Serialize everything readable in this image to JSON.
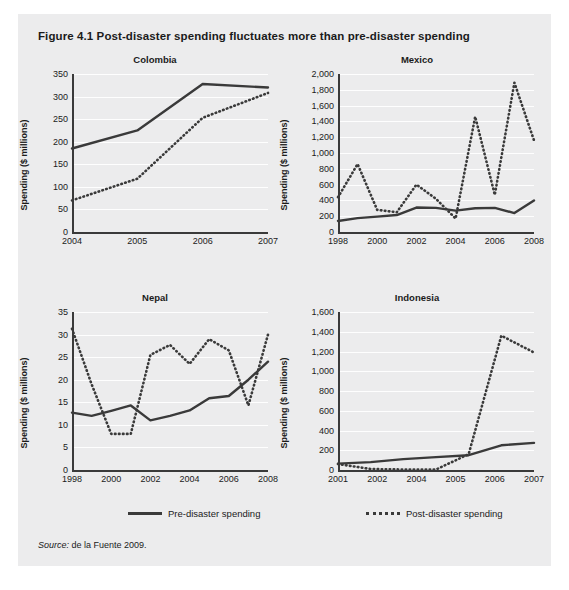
{
  "figure": {
    "number": "Figure 4.1",
    "title": "Figure 4.1  Post-disaster spending fluctuates more than pre-disaster spending",
    "source_label": "Source:",
    "source_text": "de la Fuente 2009."
  },
  "legend": {
    "pre_label": "Pre-disaster spending",
    "post_label": "Post-disaster spending",
    "series_colors": {
      "pre": "#3a3a3a",
      "post": "#3a3a3a"
    },
    "position": "bottom"
  },
  "chart_data": [
    {
      "type": "line",
      "title": "Colombia",
      "xlabel": "",
      "ylabel": "Spending ($ millions)",
      "x": [
        2004,
        2005,
        2006,
        2007
      ],
      "xticks": [
        "2004",
        "2005",
        "2006",
        "2007"
      ],
      "yticks": [
        "0",
        "50",
        "100",
        "150",
        "200",
        "250",
        "300",
        "350"
      ],
      "ylim": [
        0,
        350
      ],
      "grid": true,
      "series": [
        {
          "name": "Pre-disaster spending",
          "style": "solid",
          "values": [
            185,
            225,
            328,
            320
          ]
        },
        {
          "name": "Post-disaster spending",
          "style": "dotted",
          "values": [
            70,
            118,
            253,
            308
          ]
        }
      ]
    },
    {
      "type": "line",
      "title": "Mexico",
      "xlabel": "",
      "ylabel": "Spending ($ millions)",
      "x": [
        1998,
        1999,
        2000,
        2001,
        2002,
        2003,
        2004,
        2005,
        2006,
        2007,
        2008
      ],
      "xticks": [
        "1998",
        "2000",
        "2002",
        "2004",
        "2006",
        "2008"
      ],
      "yticks": [
        "0",
        "200",
        "400",
        "600",
        "800",
        "1,000",
        "1,200",
        "1,400",
        "1,600",
        "1,800",
        "2,000"
      ],
      "ylim": [
        0,
        2000
      ],
      "grid": true,
      "series": [
        {
          "name": "Pre-disaster spending",
          "style": "solid",
          "values": [
            140,
            175,
            195,
            215,
            310,
            305,
            270,
            300,
            305,
            240,
            400
          ]
        },
        {
          "name": "Post-disaster spending",
          "style": "dotted",
          "values": [
            440,
            860,
            280,
            250,
            600,
            420,
            170,
            1460,
            470,
            1890,
            1160
          ]
        }
      ]
    },
    {
      "type": "line",
      "title": "Nepal",
      "xlabel": "",
      "ylabel": "Spending ($ millions)",
      "x": [
        1998,
        1999,
        2000,
        2001,
        2002,
        2003,
        2004,
        2005,
        2006,
        2007,
        2008
      ],
      "xticks": [
        "1998",
        "2000",
        "2002",
        "2004",
        "2006",
        "2008"
      ],
      "yticks": [
        "0",
        "5",
        "10",
        "15",
        "20",
        "25",
        "30",
        "35"
      ],
      "ylim": [
        0,
        35
      ],
      "grid": true,
      "series": [
        {
          "name": "Pre-disaster spending",
          "style": "solid",
          "values": [
            12.7,
            12.0,
            13.1,
            14.3,
            11.0,
            12.0,
            13.2,
            15.9,
            16.4,
            20.0,
            24.0
          ]
        },
        {
          "name": "Post-disaster spending",
          "style": "dotted",
          "values": [
            31.3,
            19.0,
            8.0,
            8.0,
            25.5,
            27.7,
            23.5,
            29.0,
            26.5,
            14.3,
            30.0
          ]
        }
      ]
    },
    {
      "type": "line",
      "title": "Indonesia",
      "xlabel": "",
      "ylabel": "Spending ($ millions)",
      "x": [
        2001,
        2002,
        2003,
        2004,
        2005,
        2006,
        2007
      ],
      "xticks": [
        "2001",
        "2002",
        "2004",
        "2005",
        "2006",
        "2007"
      ],
      "yticks": [
        "0",
        "200",
        "400",
        "600",
        "800",
        "1,000",
        "1,200",
        "1,400",
        "1,600"
      ],
      "ylim": [
        0,
        1600
      ],
      "grid": true,
      "series": [
        {
          "name": "Pre-disaster spending",
          "style": "solid",
          "values": [
            65,
            80,
            110,
            130,
            150,
            250,
            275
          ]
        },
        {
          "name": "Post-disaster spending",
          "style": "dotted",
          "values": [
            60,
            10,
            5,
            5,
            160,
            1360,
            1190
          ]
        }
      ]
    }
  ]
}
